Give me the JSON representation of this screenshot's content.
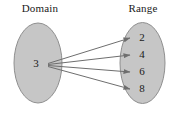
{
  "figure": {
    "type": "mapping-diagram",
    "domain_label": "Domain",
    "range_label": "Range",
    "domain_elements": [
      "3"
    ],
    "range_elements": [
      "2",
      "4",
      "6",
      "8"
    ],
    "mappings": [
      {
        "from": "3",
        "to": "2"
      },
      {
        "from": "3",
        "to": "4"
      },
      {
        "from": "3",
        "to": "6"
      },
      {
        "from": "3",
        "to": "8"
      }
    ],
    "colors": {
      "ellipse_fill": "#c6c6c6",
      "ellipse_stroke": "#8f8f8f",
      "arrow": "#6e6e6e",
      "text": "#1a1a1a",
      "background": "#ffffff"
    }
  }
}
